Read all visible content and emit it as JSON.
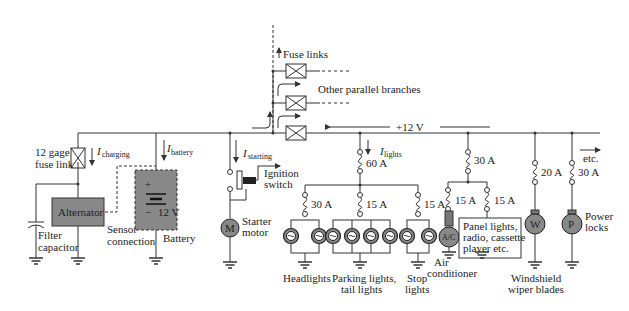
{
  "diagram": {
    "bus_voltage": "+12 V",
    "etc_label": "etc.",
    "fuse_links": {
      "label": "Fuse links",
      "branches_label": "Other parallel branches"
    },
    "left": {
      "fuse_link_label_1": "12 gage",
      "fuse_link_label_2": "fuse link",
      "i_charging": "I",
      "i_charging_sub": "charging",
      "i_battery": "I",
      "i_battery_sub": "battery",
      "alternator": "Alternator",
      "sensor_1": "Sensor",
      "sensor_2": "connection",
      "filter_1": "Filter",
      "filter_2": "capacitor",
      "battery": "Battery",
      "battery_plus": "+",
      "battery_minus": "−",
      "battery_voltage": "12 V"
    },
    "starter": {
      "i": "I",
      "i_sub": "starting",
      "ignition_1": "Ignition",
      "ignition_2": "switch",
      "motor_symbol": "M",
      "motor_1": "Starter",
      "motor_2": "motor"
    },
    "lights": {
      "i": "I",
      "i_sub": "lights",
      "main_fuse": "60 A",
      "headlights_fuse": "30 A",
      "parking_fuse": "15 A",
      "stop_fuse": "15 A",
      "headlights": "Headlights",
      "parking_1": "Parking lights,",
      "parking_2": "tail lights",
      "stop_1": "Stop",
      "stop_2": "lights"
    },
    "accessories": {
      "main_fuse": "30 A",
      "ac_fuse": "15 A",
      "panel_fuse": "15 A",
      "ac_symbol": "A/C",
      "ac_1": "Air",
      "ac_2": "conditioner",
      "panel_1": "Panel lights,",
      "panel_2": "radio, cassette",
      "panel_3": "player etc."
    },
    "wiper": {
      "fuse": "20 A",
      "symbol": "W",
      "label_1": "Windshield",
      "label_2": "wiper blades"
    },
    "locks": {
      "fuse": "30 A",
      "symbol": "P",
      "label_1": "Power",
      "label_2": "locks"
    }
  }
}
